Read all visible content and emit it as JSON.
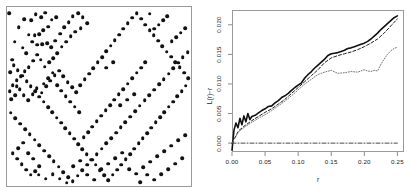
{
  "figure": {
    "title": "",
    "panels": [
      "point-pattern",
      "l-function"
    ]
  },
  "left_panel": {
    "name": "spatial point pattern",
    "axis_labels_shown": false,
    "frame": true
  },
  "right_panel": {
    "y_axis_title": "L(r)−r",
    "x_axis_title": "r"
  },
  "chart_data": [
    {
      "type": "scatter",
      "title": "",
      "xlabel": "",
      "ylabel": "",
      "xlim": [
        0,
        1
      ],
      "ylim": [
        0,
        1
      ],
      "grid": false,
      "legend": "none",
      "marker": "filled-circle",
      "marker_color": "#111111",
      "n_points": 250,
      "points": [
        [
          0.012,
          0.965
        ],
        [
          0.041,
          0.806
        ],
        [
          0.027,
          0.705
        ],
        [
          0.018,
          0.637
        ],
        [
          0.052,
          0.556
        ],
        [
          0.024,
          0.486
        ],
        [
          0.063,
          0.888
        ],
        [
          0.095,
          0.932
        ],
        [
          0.118,
          0.846
        ],
        [
          0.086,
          0.773
        ],
        [
          0.104,
          0.742
        ],
        [
          0.132,
          0.926
        ],
        [
          0.157,
          0.96
        ],
        [
          0.185,
          0.944
        ],
        [
          0.209,
          0.968
        ],
        [
          0.243,
          0.93
        ],
        [
          0.268,
          0.944
        ],
        [
          0.225,
          0.889
        ],
        [
          0.196,
          0.871
        ],
        [
          0.176,
          0.848
        ],
        [
          0.151,
          0.842
        ],
        [
          0.137,
          0.805
        ],
        [
          0.165,
          0.79
        ],
        [
          0.192,
          0.792
        ],
        [
          0.218,
          0.799
        ],
        [
          0.24,
          0.776
        ],
        [
          0.262,
          0.812
        ],
        [
          0.288,
          0.85
        ],
        [
          0.311,
          0.887
        ],
        [
          0.335,
          0.915
        ],
        [
          0.358,
          0.948
        ],
        [
          0.386,
          0.966
        ],
        [
          0.412,
          0.942
        ],
        [
          0.437,
          0.908
        ],
        [
          0.401,
          0.882
        ],
        [
          0.372,
          0.861
        ],
        [
          0.347,
          0.837
        ],
        [
          0.323,
          0.806
        ],
        [
          0.297,
          0.779
        ],
        [
          0.274,
          0.742
        ],
        [
          0.251,
          0.714
        ],
        [
          0.229,
          0.69
        ],
        [
          0.206,
          0.666
        ],
        [
          0.184,
          0.706
        ],
        [
          0.163,
          0.733
        ],
        [
          0.142,
          0.699
        ],
        [
          0.119,
          0.665
        ],
        [
          0.097,
          0.64
        ],
        [
          0.074,
          0.615
        ],
        [
          0.052,
          0.592
        ],
        [
          0.031,
          0.562
        ],
        [
          0.015,
          0.53
        ],
        [
          0.044,
          0.508
        ],
        [
          0.068,
          0.54
        ],
        [
          0.09,
          0.508
        ],
        [
          0.115,
          0.478
        ],
        [
          0.139,
          0.512
        ],
        [
          0.162,
          0.546
        ],
        [
          0.188,
          0.522
        ],
        [
          0.212,
          0.556
        ],
        [
          0.236,
          0.589
        ],
        [
          0.259,
          0.618
        ],
        [
          0.283,
          0.645
        ],
        [
          0.306,
          0.613
        ],
        [
          0.33,
          0.58
        ],
        [
          0.353,
          0.552
        ],
        [
          0.377,
          0.524
        ],
        [
          0.399,
          0.563
        ],
        [
          0.423,
          0.596
        ],
        [
          0.446,
          0.628
        ],
        [
          0.47,
          0.659
        ],
        [
          0.493,
          0.69
        ],
        [
          0.516,
          0.72
        ],
        [
          0.54,
          0.752
        ],
        [
          0.563,
          0.784
        ],
        [
          0.586,
          0.815
        ],
        [
          0.61,
          0.846
        ],
        [
          0.633,
          0.878
        ],
        [
          0.657,
          0.91
        ],
        [
          0.68,
          0.941
        ],
        [
          0.704,
          0.966
        ],
        [
          0.728,
          0.934
        ],
        [
          0.751,
          0.902
        ],
        [
          0.775,
          0.872
        ],
        [
          0.798,
          0.842
        ],
        [
          0.822,
          0.812
        ],
        [
          0.845,
          0.782
        ],
        [
          0.868,
          0.751
        ],
        [
          0.892,
          0.722
        ],
        [
          0.915,
          0.692
        ],
        [
          0.938,
          0.663
        ],
        [
          0.962,
          0.632
        ],
        [
          0.984,
          0.602
        ],
        [
          0.972,
          0.56
        ],
        [
          0.949,
          0.531
        ],
        [
          0.925,
          0.501
        ],
        [
          0.902,
          0.472
        ],
        [
          0.879,
          0.443
        ],
        [
          0.855,
          0.413
        ],
        [
          0.832,
          0.384
        ],
        [
          0.808,
          0.355
        ],
        [
          0.785,
          0.325
        ],
        [
          0.762,
          0.296
        ],
        [
          0.738,
          0.267
        ],
        [
          0.715,
          0.238
        ],
        [
          0.691,
          0.208
        ],
        [
          0.668,
          0.179
        ],
        [
          0.645,
          0.15
        ],
        [
          0.621,
          0.12
        ],
        [
          0.598,
          0.091
        ],
        [
          0.574,
          0.062
        ],
        [
          0.551,
          0.033
        ],
        [
          0.528,
          0.059
        ],
        [
          0.504,
          0.089
        ],
        [
          0.481,
          0.118
        ],
        [
          0.457,
          0.147
        ],
        [
          0.434,
          0.177
        ],
        [
          0.41,
          0.206
        ],
        [
          0.387,
          0.235
        ],
        [
          0.364,
          0.265
        ],
        [
          0.34,
          0.294
        ],
        [
          0.317,
          0.323
        ],
        [
          0.293,
          0.353
        ],
        [
          0.27,
          0.382
        ],
        [
          0.246,
          0.411
        ],
        [
          0.223,
          0.441
        ],
        [
          0.2,
          0.47
        ],
        [
          0.176,
          0.499
        ],
        [
          0.153,
          0.528
        ],
        [
          0.129,
          0.558
        ],
        [
          0.106,
          0.587
        ],
        [
          0.082,
          0.616
        ],
        [
          0.059,
          0.646
        ],
        [
          0.036,
          0.675
        ],
        [
          0.02,
          0.41
        ],
        [
          0.046,
          0.378
        ],
        [
          0.072,
          0.348
        ],
        [
          0.098,
          0.318
        ],
        [
          0.124,
          0.288
        ],
        [
          0.15,
          0.258
        ],
        [
          0.176,
          0.228
        ],
        [
          0.202,
          0.198
        ],
        [
          0.228,
          0.168
        ],
        [
          0.254,
          0.138
        ],
        [
          0.28,
          0.108
        ],
        [
          0.306,
          0.078
        ],
        [
          0.332,
          0.048
        ],
        [
          0.358,
          0.028
        ],
        [
          0.384,
          0.058
        ],
        [
          0.41,
          0.088
        ],
        [
          0.436,
          0.118
        ],
        [
          0.462,
          0.148
        ],
        [
          0.488,
          0.178
        ],
        [
          0.514,
          0.208
        ],
        [
          0.54,
          0.238
        ],
        [
          0.566,
          0.268
        ],
        [
          0.592,
          0.298
        ],
        [
          0.618,
          0.328
        ],
        [
          0.644,
          0.358
        ],
        [
          0.67,
          0.388
        ],
        [
          0.696,
          0.418
        ],
        [
          0.722,
          0.448
        ],
        [
          0.748,
          0.478
        ],
        [
          0.774,
          0.508
        ],
        [
          0.8,
          0.538
        ],
        [
          0.826,
          0.568
        ],
        [
          0.852,
          0.598
        ],
        [
          0.878,
          0.628
        ],
        [
          0.904,
          0.658
        ],
        [
          0.93,
          0.688
        ],
        [
          0.956,
          0.718
        ],
        [
          0.982,
          0.748
        ],
        [
          0.968,
          0.88
        ],
        [
          0.944,
          0.856
        ],
        [
          0.92,
          0.832
        ],
        [
          0.896,
          0.808
        ],
        [
          0.872,
          0.95
        ],
        [
          0.848,
          0.926
        ],
        [
          0.824,
          0.902
        ],
        [
          0.8,
          0.878
        ],
        [
          0.776,
          0.962
        ],
        [
          0.752,
          0.692
        ],
        [
          0.728,
          0.662
        ],
        [
          0.704,
          0.632
        ],
        [
          0.68,
          0.602
        ],
        [
          0.656,
          0.572
        ],
        [
          0.632,
          0.542
        ],
        [
          0.608,
          0.512
        ],
        [
          0.584,
          0.482
        ],
        [
          0.56,
          0.452
        ],
        [
          0.536,
          0.422
        ],
        [
          0.512,
          0.392
        ],
        [
          0.488,
          0.362
        ],
        [
          0.464,
          0.332
        ],
        [
          0.44,
          0.302
        ],
        [
          0.416,
          0.272
        ],
        [
          0.392,
          0.412
        ],
        [
          0.368,
          0.442
        ],
        [
          0.344,
          0.472
        ],
        [
          0.32,
          0.502
        ],
        [
          0.296,
          0.532
        ],
        [
          0.272,
          0.562
        ],
        [
          0.248,
          0.632
        ],
        [
          0.224,
          0.602
        ],
        [
          0.2,
          0.572
        ],
        [
          0.176,
          0.112
        ],
        [
          0.152,
          0.082
        ],
        [
          0.128,
          0.062
        ],
        [
          0.104,
          0.092
        ],
        [
          0.08,
          0.122
        ],
        [
          0.056,
          0.152
        ],
        [
          0.032,
          0.182
        ],
        [
          0.06,
          0.212
        ],
        [
          0.088,
          0.242
        ],
        [
          0.116,
          0.182
        ],
        [
          0.144,
          0.152
        ],
        [
          0.172,
          0.062
        ],
        [
          0.21,
          0.04
        ],
        [
          0.248,
          0.065
        ],
        [
          0.286,
          0.04
        ],
        [
          0.324,
          0.018
        ],
        [
          0.36,
          0.112
        ],
        [
          0.398,
          0.142
        ],
        [
          0.436,
          0.062
        ],
        [
          0.474,
          0.035
        ],
        [
          0.512,
          0.095
        ],
        [
          0.55,
          0.125
        ],
        [
          0.588,
          0.155
        ],
        [
          0.626,
          0.185
        ],
        [
          0.664,
          0.095
        ],
        [
          0.702,
          0.068
        ],
        [
          0.74,
          0.105
        ],
        [
          0.778,
          0.135
        ],
        [
          0.816,
          0.165
        ],
        [
          0.854,
          0.195
        ],
        [
          0.892,
          0.225
        ],
        [
          0.93,
          0.255
        ],
        [
          0.968,
          0.285
        ],
        [
          0.952,
          0.155
        ],
        [
          0.914,
          0.125
        ],
        [
          0.876,
          0.095
        ],
        [
          0.838,
          0.065
        ],
        [
          0.8,
          0.035
        ],
        [
          0.762,
          0.062
        ],
        [
          0.724,
          0.022
        ],
        [
          0.69,
          0.512
        ],
        [
          0.652,
          0.482
        ],
        [
          0.614,
          0.452
        ],
        [
          0.576,
          0.692
        ],
        [
          0.538,
          0.662
        ]
      ]
    },
    {
      "type": "line",
      "title": "",
      "xlabel": "r",
      "ylabel": "L(r)−r",
      "xlim": [
        0,
        0.26
      ],
      "ylim": [
        -0.0015,
        0.0225
      ],
      "grid": false,
      "legend": "none",
      "xticks": [
        "0.00",
        "0.05",
        "0.10",
        "0.15",
        "0.20",
        "0.25"
      ],
      "xtick_values": [
        0.0,
        0.05,
        0.1,
        0.15,
        0.2,
        0.25
      ],
      "yticks": [
        "0.000",
        "0.005",
        "0.010",
        "0.015",
        "0.020"
      ],
      "ytick_values": [
        0.0,
        0.005,
        0.01,
        0.015,
        0.02
      ],
      "series": [
        {
          "name": "observed",
          "style": "solid",
          "color": "#111111",
          "width": 1.6,
          "x": [
            0.0,
            0.003,
            0.006,
            0.009,
            0.012,
            0.015,
            0.018,
            0.021,
            0.024,
            0.027,
            0.03,
            0.035,
            0.04,
            0.045,
            0.05,
            0.055,
            0.06,
            0.065,
            0.07,
            0.075,
            0.08,
            0.085,
            0.09,
            0.095,
            0.1,
            0.105,
            0.11,
            0.115,
            0.12,
            0.125,
            0.13,
            0.135,
            0.14,
            0.145,
            0.15,
            0.155,
            0.16,
            0.165,
            0.17,
            0.175,
            0.18,
            0.185,
            0.19,
            0.195,
            0.2,
            0.205,
            0.21,
            0.215,
            0.22,
            0.225,
            0.23,
            0.235,
            0.24,
            0.245,
            0.25
          ],
          "y": [
            -0.0012,
            0.0022,
            0.0034,
            0.0026,
            0.0042,
            0.0031,
            0.0046,
            0.0036,
            0.005,
            0.004,
            0.0045,
            0.0047,
            0.0051,
            0.0055,
            0.0058,
            0.0062,
            0.0063,
            0.0068,
            0.0072,
            0.0077,
            0.008,
            0.0084,
            0.0089,
            0.0094,
            0.0098,
            0.0102,
            0.011,
            0.0116,
            0.0121,
            0.0127,
            0.0132,
            0.0137,
            0.0142,
            0.0148,
            0.0151,
            0.0152,
            0.0153,
            0.0155,
            0.0157,
            0.016,
            0.0161,
            0.0163,
            0.0165,
            0.0167,
            0.0169,
            0.0172,
            0.0176,
            0.0181,
            0.0186,
            0.0192,
            0.0197,
            0.0202,
            0.0207,
            0.0212,
            0.0215
          ]
        },
        {
          "name": "theoretical-upper",
          "style": "dashed",
          "color": "#222222",
          "width": 1.0,
          "x": [
            0.0,
            0.01,
            0.02,
            0.03,
            0.04,
            0.05,
            0.06,
            0.07,
            0.08,
            0.09,
            0.1,
            0.11,
            0.12,
            0.13,
            0.14,
            0.15,
            0.16,
            0.17,
            0.18,
            0.19,
            0.2,
            0.21,
            0.22,
            0.23,
            0.24,
            0.25
          ],
          "y": [
            0.0,
            0.0021,
            0.003,
            0.0038,
            0.0045,
            0.0052,
            0.0058,
            0.0066,
            0.0074,
            0.0084,
            0.0094,
            0.0104,
            0.0114,
            0.0124,
            0.0136,
            0.0144,
            0.0148,
            0.0151,
            0.0154,
            0.0158,
            0.0163,
            0.0169,
            0.0176,
            0.0186,
            0.0198,
            0.021
          ]
        },
        {
          "name": "envelope-lower",
          "style": "dotted",
          "color": "#777777",
          "width": 1.0,
          "x": [
            0.0,
            0.01,
            0.02,
            0.03,
            0.04,
            0.05,
            0.06,
            0.07,
            0.08,
            0.09,
            0.1,
            0.11,
            0.12,
            0.13,
            0.14,
            0.15,
            0.16,
            0.17,
            0.18,
            0.19,
            0.2,
            0.205,
            0.21,
            0.215,
            0.22,
            0.225,
            0.23,
            0.235,
            0.24,
            0.245,
            0.25
          ],
          "y": [
            0.0,
            0.0019,
            0.0028,
            0.0035,
            0.0042,
            0.0048,
            0.0055,
            0.0063,
            0.0071,
            0.008,
            0.009,
            0.01,
            0.0108,
            0.0116,
            0.012,
            0.0123,
            0.0118,
            0.0119,
            0.0121,
            0.012,
            0.0124,
            0.0122,
            0.0121,
            0.0123,
            0.0122,
            0.0133,
            0.0142,
            0.015,
            0.0156,
            0.016,
            0.0162
          ]
        },
        {
          "name": "reference-zero",
          "style": "dashdot",
          "color": "#333333",
          "width": 0.9,
          "x": [
            0.0,
            0.25
          ],
          "y": [
            0.0,
            0.0
          ]
        }
      ]
    }
  ]
}
